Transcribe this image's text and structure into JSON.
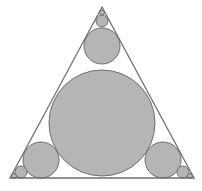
{
  "diagram": {
    "type": "circles-inscribed-in-triangle",
    "colors": {
      "fill": "#b5b5b5",
      "stroke": "#6e6e6e",
      "background": "#ffffff"
    },
    "triangle": {
      "points": [
        [
          102,
          7
        ],
        [
          194,
          178
        ],
        [
          10,
          178
        ]
      ]
    },
    "circles": [
      {
        "id": "big",
        "cx": 102,
        "cy": 123,
        "r": 53
      },
      {
        "id": "top-medium",
        "cx": 102,
        "cy": 46,
        "r": 18
      },
      {
        "id": "top-small",
        "cx": 102,
        "cy": 21,
        "r": 6
      },
      {
        "id": "top-tiny",
        "cx": 102,
        "cy": 12.5,
        "r": 2.5
      },
      {
        "id": "left-medium",
        "cx": 41,
        "cy": 160,
        "r": 18
      },
      {
        "id": "left-small",
        "cx": 21,
        "cy": 172,
        "r": 6
      },
      {
        "id": "left-tiny",
        "cx": 14,
        "cy": 176,
        "r": 2.5
      },
      {
        "id": "right-medium",
        "cx": 163,
        "cy": 160,
        "r": 18
      },
      {
        "id": "right-small",
        "cx": 183,
        "cy": 172,
        "r": 6
      },
      {
        "id": "right-tiny",
        "cx": 190,
        "cy": 176,
        "r": 2.5
      }
    ]
  }
}
